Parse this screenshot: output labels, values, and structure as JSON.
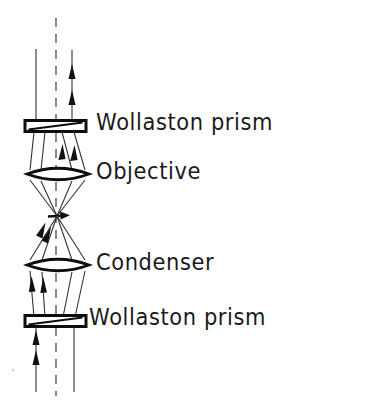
{
  "figure": {
    "background_color": "#ffffff",
    "ink_color": "#111111",
    "width": 373,
    "height": 402
  },
  "labels": {
    "wollaston_top": "Wollaston prism",
    "objective": "Objective",
    "condenser": "Condenser",
    "wollaston_bottom": "Wollaston prism"
  },
  "components": [
    {
      "id": "wollaston-prism-top",
      "name": "Wollaston prism",
      "type": "prism",
      "label": "Wollaston prism",
      "y": 125,
      "x_left": 25,
      "x_right": 86,
      "thickness": 11
    },
    {
      "id": "objective-lens",
      "name": "Objective",
      "type": "lens",
      "label": "Objective",
      "y": 174,
      "x_left": 27,
      "x_right": 89,
      "thickness": 15
    },
    {
      "id": "condenser-lens",
      "name": "Condenser",
      "type": "lens",
      "label": "Condenser",
      "y": 265,
      "x_left": 27,
      "x_right": 89,
      "thickness": 15
    },
    {
      "id": "wollaston-prism-bottom",
      "name": "Wollaston prism",
      "type": "prism",
      "label": "Wollaston prism",
      "y": 320,
      "x_left": 25,
      "x_right": 86,
      "thickness": 11
    }
  ],
  "optical_axis": {
    "name": "optical-axis",
    "style": "dashed",
    "x": 56,
    "y_top": 18,
    "y_bottom": 396
  },
  "rays": {
    "description": "Two sheared polarised beams traced from bottom Wollaston prism up through condenser, specimen focus, objective and top Wollaston prism",
    "direction": "upward",
    "count": 3,
    "top_exit_x": [
      36,
      56,
      72
    ],
    "bottom_entry_x": [
      36,
      56,
      72
    ],
    "focus_point": {
      "x": 57,
      "y": 216
    },
    "arrow_marks": 10
  }
}
